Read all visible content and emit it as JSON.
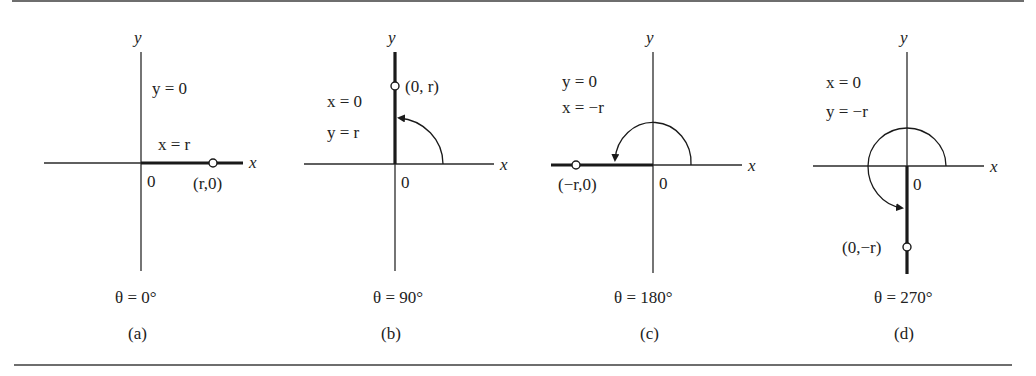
{
  "figure": {
    "panels": [
      {
        "id": "a",
        "caption": "(a)",
        "angle_label": "θ = 0°",
        "angle_deg": 0,
        "axis_labels": {
          "x": "x",
          "y": "y",
          "origin": "0"
        },
        "equations": [
          "y = 0",
          "x = r"
        ],
        "point_label": "(r,0)"
      },
      {
        "id": "b",
        "caption": "(b)",
        "angle_label": "θ = 90°",
        "angle_deg": 90,
        "axis_labels": {
          "x": "x",
          "y": "y",
          "origin": "0"
        },
        "equations": [
          "x = 0",
          "y = r"
        ],
        "point_label": "(0, r)"
      },
      {
        "id": "c",
        "caption": "(c)",
        "angle_label": "θ = 180°",
        "angle_deg": 180,
        "axis_labels": {
          "x": "x",
          "y": "y",
          "origin": "0"
        },
        "equations": [
          "y = 0",
          "x = −r"
        ],
        "point_label": "(−r,0)"
      },
      {
        "id": "d",
        "caption": "(d)",
        "angle_label": "θ = 270°",
        "angle_deg": 270,
        "axis_labels": {
          "x": "x",
          "y": "y",
          "origin": "0"
        },
        "equations": [
          "x = 0",
          "y = −r"
        ],
        "point_label": "(0,−r)"
      }
    ]
  }
}
